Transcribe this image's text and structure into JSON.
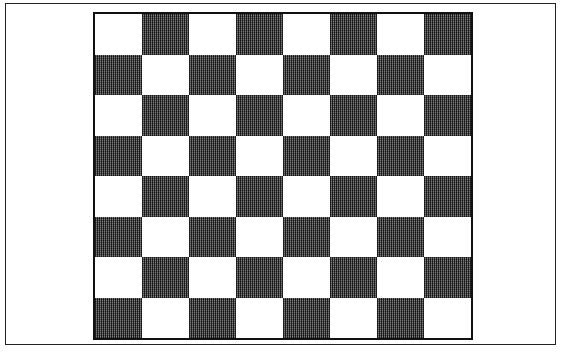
{
  "board": {
    "rows": 8,
    "cols": 8,
    "top_left_color": "light",
    "colors": {
      "light": "#ffffff",
      "dark": "#6a6a6a",
      "border": "#111111",
      "frame": "#222222"
    },
    "pieces": []
  }
}
